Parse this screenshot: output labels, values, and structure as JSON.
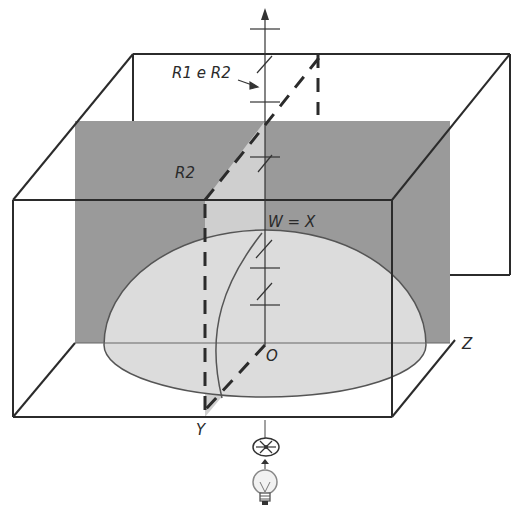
{
  "diagram": {
    "type": "3d-box-illustration",
    "labels": {
      "r1_r2": "R1 e R2",
      "r2": "R2",
      "w_x": "W = X",
      "origin": "O",
      "axis_y": "Y",
      "axis_z": "Z"
    },
    "icons": {
      "polarizer": "polarizer-disc-icon",
      "light_source": "light-bulb-icon"
    },
    "colors": {
      "line": "#2b2b2b",
      "back_plane": "#9a9a9a",
      "light_plane": "#cfcfcf",
      "dome": "#dcdcdc",
      "background": "#ffffff"
    }
  }
}
